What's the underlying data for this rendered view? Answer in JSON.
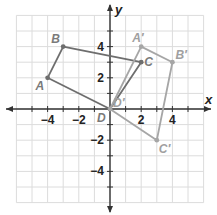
{
  "figure": {
    "axes": {
      "x_label": "x",
      "y_label": "y",
      "x_ticks": [
        {
          "value": -4,
          "label": "−4"
        },
        {
          "value": -2,
          "label": "−2"
        },
        {
          "value": 2,
          "label": "2"
        },
        {
          "value": 4,
          "label": "4"
        }
      ],
      "y_ticks": [
        {
          "value": 4,
          "label": "4"
        },
        {
          "value": 2,
          "label": "2"
        },
        {
          "value": -2,
          "label": "−2"
        },
        {
          "value": -4,
          "label": "−4"
        }
      ],
      "range": {
        "xmin": -6,
        "xmax": 6,
        "ymin": -6,
        "ymax": 6
      }
    },
    "original_figure": {
      "name": "ABCD",
      "color": "#707070",
      "points": [
        {
          "label": "A",
          "x": -4,
          "y": 2
        },
        {
          "label": "B",
          "x": -3,
          "y": 4
        },
        {
          "label": "C",
          "x": 2,
          "y": 3
        },
        {
          "label": "D",
          "x": 0,
          "y": 0
        }
      ]
    },
    "image_figure": {
      "name": "A'B'C'D'",
      "color": "#a8a8a8",
      "points": [
        {
          "label": "A′",
          "x": 2,
          "y": 4
        },
        {
          "label": "B′",
          "x": 4,
          "y": 3
        },
        {
          "label": "C′",
          "x": 3,
          "y": -2
        },
        {
          "label": "D′",
          "x": 0,
          "y": 0
        }
      ]
    },
    "colors": {
      "grid": "#dcdcdc",
      "axis": "#333333",
      "original": "#6e6e6e",
      "image": "#a6a6a6",
      "label_original": "#7a7a7a",
      "label_image": "#a0a0a0"
    }
  }
}
